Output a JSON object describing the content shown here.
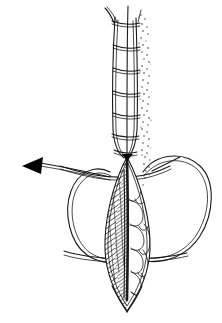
{
  "figure": {
    "title": "Continuous subcuticular wound closure with buried suture loops",
    "caption": "",
    "background_color": "#ffffff",
    "ink_color": "#1a1a1a",
    "width": 222,
    "height": 323,
    "style": "black and white line drawing, pen and ink, medical illustration"
  },
  "annotations": {
    "direction_arrow": {
      "name": "pull-direction-arrow",
      "label": "",
      "points_to": "left",
      "tip_x": 24,
      "tip_y": 166,
      "base_x": 41,
      "base_y": 160,
      "color": "#000000"
    }
  },
  "parts": {
    "suture_ladder": {
      "label": "",
      "rung_count": 7,
      "left_edge_x": 112,
      "right_edge_x": 138,
      "top_y": 12,
      "bottom_y": 158
    },
    "wound_ellipse": {
      "label": "",
      "top_y": 157,
      "bottom_y": 311,
      "left_x": 103,
      "right_x": 152,
      "left_half_texture": "diagonal-hatching",
      "right_half_texture": "polygonal-cells"
    },
    "loops": {
      "label": "",
      "count": 2,
      "left_loop_extent_x": 66,
      "right_loop_extent_x": 213
    },
    "stipple": {
      "label": "",
      "side": "right",
      "top_y": 14,
      "bottom_y": 190
    }
  }
}
